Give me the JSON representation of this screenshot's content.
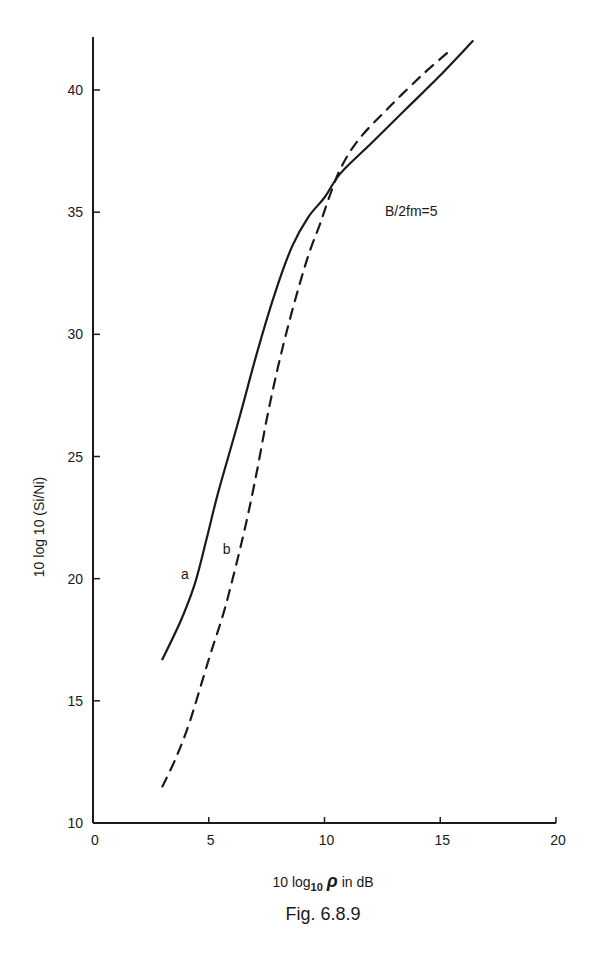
{
  "figure": {
    "caption": "Fig. 6.8.9",
    "annotation": "B/2fm=5"
  },
  "chart_data": {
    "type": "line",
    "title": "",
    "annotation": "B/2fm=5",
    "caption": "Fig. 6.8.9",
    "xlabel": "10 log10 ρ in dB",
    "xlabel_parts": {
      "pre": "10 log",
      "sub": "10",
      "rho": "ρ",
      "post": " in dB"
    },
    "ylabel": "10 log 10 (Si/Ni)",
    "xlim": [
      0,
      20
    ],
    "ylim": [
      10,
      42
    ],
    "xticks": [
      0,
      5,
      10,
      15,
      20
    ],
    "yticks": [
      10,
      15,
      20,
      25,
      30,
      35,
      40
    ],
    "grid": false,
    "legend": "inline labels",
    "series": [
      {
        "name": "a",
        "style": "solid",
        "label_pos": [
          3.8,
          20.0
        ],
        "x": [
          3.0,
          3.8,
          4.4,
          4.9,
          5.4,
          6.3,
          7.1,
          7.9,
          8.6,
          9.3,
          10.0,
          10.7,
          12.0,
          13.5,
          15.0,
          16.4
        ],
        "y": [
          16.7,
          18.3,
          19.8,
          21.6,
          23.5,
          26.5,
          29.3,
          31.8,
          33.6,
          34.8,
          35.6,
          36.6,
          37.8,
          39.2,
          40.6,
          42.0
        ]
      },
      {
        "name": "b",
        "style": "dashed",
        "label_pos": [
          5.6,
          21.0
        ],
        "x": [
          3.0,
          3.6,
          4.2,
          5.0,
          5.7,
          6.45,
          7.0,
          7.5,
          8.0,
          8.5,
          9.0,
          9.4,
          9.8,
          10.2,
          10.7,
          11.5,
          12.8,
          14.2,
          15.4
        ],
        "y": [
          11.5,
          12.7,
          14.2,
          16.7,
          18.8,
          21.6,
          24.0,
          26.5,
          28.7,
          30.6,
          32.3,
          33.5,
          34.5,
          35.6,
          36.8,
          38.0,
          39.3,
          40.6,
          41.6
        ]
      }
    ]
  }
}
